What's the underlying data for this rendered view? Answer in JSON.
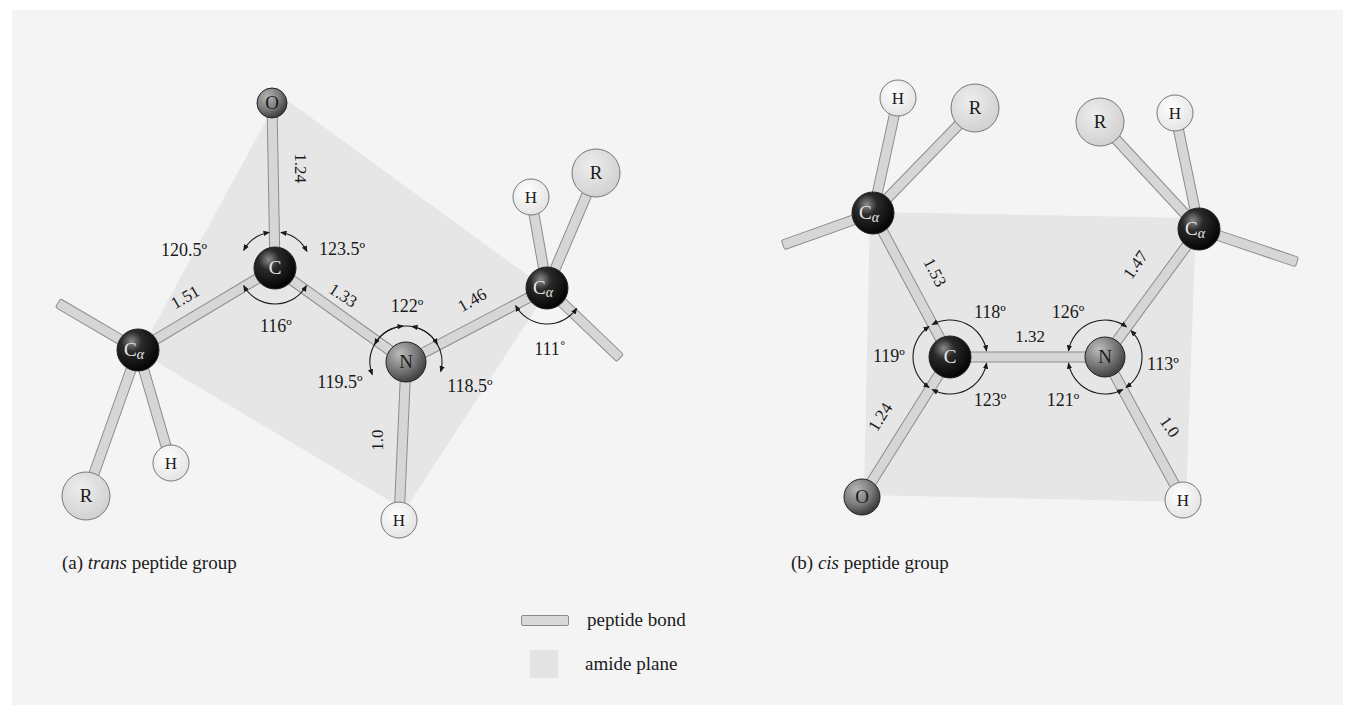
{
  "colors": {
    "background": "#ffffff",
    "panel": "#f4f4f4",
    "amide_plane": "#e3e3e3",
    "bond_fill": "#d6d6d6",
    "bond_stroke": "#8c8c8c",
    "carbon": "#151515",
    "nitrogen": "#6f6f6f",
    "oxygen": "#777777",
    "hydrogen": "#f0f0f0",
    "r_group": "#dcdcdc",
    "text": "#1a1a1a"
  },
  "panels": [
    {
      "id": "trans",
      "caption_prefix": "(a) ",
      "caption_italic": "trans",
      "caption_suffix": " peptide group",
      "amide_plane": [
        [
          140,
          352
        ],
        [
          280,
          95
        ],
        [
          548,
          290
        ],
        [
          405,
          510
        ]
      ],
      "atoms": [
        {
          "id": "O",
          "label": "O",
          "x": 272,
          "y": 103,
          "r": 15,
          "type": "oxygen"
        },
        {
          "id": "C",
          "label": "C",
          "x": 275,
          "y": 268,
          "r": 21,
          "type": "carbon"
        },
        {
          "id": "N",
          "label": "N",
          "x": 406,
          "y": 362,
          "r": 20,
          "type": "nitrogen"
        },
        {
          "id": "Ca1",
          "label": "C",
          "sub": "α",
          "x": 138,
          "y": 350,
          "r": 21,
          "type": "carbon"
        },
        {
          "id": "Ca2",
          "label": "C",
          "sub": "α",
          "x": 547,
          "y": 288,
          "r": 21,
          "type": "carbon"
        },
        {
          "id": "H_N",
          "label": "H",
          "x": 399,
          "y": 520,
          "r": 18,
          "type": "hydrogen"
        },
        {
          "id": "H1",
          "label": "H",
          "x": 171,
          "y": 463,
          "r": 18,
          "type": "hydrogen"
        },
        {
          "id": "R1",
          "label": "R",
          "x": 86,
          "y": 496,
          "r": 24,
          "type": "rgroup"
        },
        {
          "id": "H2",
          "label": "H",
          "x": 531,
          "y": 197,
          "r": 18,
          "type": "hydrogen"
        },
        {
          "id": "R2",
          "label": "R",
          "x": 596,
          "y": 173,
          "r": 24,
          "type": "rgroup"
        }
      ],
      "bonds": [
        {
          "a": "C",
          "b": "O"
        },
        {
          "a": "C",
          "b": "N"
        },
        {
          "a": "C",
          "b": "Ca1"
        },
        {
          "a": "N",
          "b": "Ca2"
        },
        {
          "a": "N",
          "b": "H_N"
        },
        {
          "a": "Ca1",
          "b": "H1"
        },
        {
          "a": "Ca1",
          "b": "R1"
        },
        {
          "a": "Ca2",
          "b": "H2"
        },
        {
          "a": "Ca2",
          "b": "R2"
        },
        {
          "a": "Ca1",
          "to": [
            58,
            303
          ]
        },
        {
          "a": "Ca2",
          "to": [
            620,
            358
          ]
        }
      ],
      "bond_lengths": [
        {
          "text": "1.24",
          "x": 295,
          "y": 168,
          "rot": 90
        },
        {
          "text": "1.51",
          "x": 188,
          "y": 302,
          "rot": -30
        },
        {
          "text": "1.33",
          "x": 340,
          "y": 300,
          "rot": 33
        },
        {
          "text": "1.46",
          "x": 475,
          "y": 305,
          "rot": -30
        },
        {
          "text": "1.0",
          "x": 383,
          "y": 440,
          "rot": -90
        }
      ],
      "angles": [
        {
          "text": "120.5º",
          "x": 184,
          "y": 256
        },
        {
          "text": "123.5º",
          "x": 342,
          "y": 255
        },
        {
          "text": "116º",
          "x": 276,
          "y": 332
        },
        {
          "text": "122º",
          "x": 407,
          "y": 312
        },
        {
          "text": "119.5º",
          "x": 340,
          "y": 388
        },
        {
          "text": "118.5º",
          "x": 470,
          "y": 392
        },
        {
          "text": "111˚",
          "x": 550,
          "y": 355
        }
      ],
      "arcs": [
        {
          "cx": 275,
          "cy": 268,
          "r": 36,
          "a1": -150,
          "a2": -100
        },
        {
          "cx": 275,
          "cy": 268,
          "r": 36,
          "a1": -80,
          "a2": -28
        },
        {
          "cx": 275,
          "cy": 268,
          "r": 36,
          "a1": 30,
          "a2": 150
        },
        {
          "cx": 406,
          "cy": 362,
          "r": 36,
          "a1": -150,
          "a2": -30
        },
        {
          "cx": 406,
          "cy": 362,
          "r": 36,
          "a1": 160,
          "a2": 265
        },
        {
          "cx": 406,
          "cy": 362,
          "r": 36,
          "a1": -80,
          "a2": 15
        },
        {
          "cx": 547,
          "cy": 288,
          "r": 36,
          "a1": 35,
          "a2": 150
        }
      ]
    },
    {
      "id": "cis",
      "caption_prefix": "(b) ",
      "caption_italic": "cis",
      "caption_suffix": " peptide group",
      "amide_plane": [
        [
          870,
          212
        ],
        [
          1196,
          218
        ],
        [
          1186,
          502
        ],
        [
          864,
          495
        ]
      ],
      "atoms": [
        {
          "id": "C",
          "label": "C",
          "x": 950,
          "y": 357,
          "r": 21,
          "type": "carbon"
        },
        {
          "id": "N",
          "label": "N",
          "x": 1105,
          "y": 357,
          "r": 20,
          "type": "nitrogen"
        },
        {
          "id": "O",
          "label": "O",
          "x": 862,
          "y": 497,
          "r": 18,
          "type": "oxygen"
        },
        {
          "id": "H_N",
          "label": "H",
          "x": 1183,
          "y": 500,
          "r": 18,
          "type": "hydrogen"
        },
        {
          "id": "Ca1",
          "label": "C",
          "sub": "α",
          "x": 873,
          "y": 213,
          "r": 21,
          "type": "carbon"
        },
        {
          "id": "Ca2",
          "label": "C",
          "sub": "α",
          "x": 1199,
          "y": 229,
          "r": 21,
          "type": "carbon"
        },
        {
          "id": "H1",
          "label": "H",
          "x": 898,
          "y": 98,
          "r": 18,
          "type": "hydrogen"
        },
        {
          "id": "R1",
          "label": "R",
          "x": 975,
          "y": 108,
          "r": 24,
          "type": "rgroup"
        },
        {
          "id": "R2",
          "label": "R",
          "x": 1100,
          "y": 122,
          "r": 24,
          "type": "rgroup"
        },
        {
          "id": "H2",
          "label": "H",
          "x": 1175,
          "y": 113,
          "r": 18,
          "type": "hydrogen"
        }
      ],
      "bonds": [
        {
          "a": "C",
          "b": "N"
        },
        {
          "a": "C",
          "b": "O"
        },
        {
          "a": "N",
          "b": "H_N"
        },
        {
          "a": "C",
          "b": "Ca1"
        },
        {
          "a": "N",
          "b": "Ca2"
        },
        {
          "a": "Ca1",
          "b": "H1"
        },
        {
          "a": "Ca1",
          "b": "R1"
        },
        {
          "a": "Ca2",
          "b": "R2"
        },
        {
          "a": "Ca2",
          "b": "H2"
        },
        {
          "a": "Ca1",
          "to": [
            783,
            245
          ]
        },
        {
          "a": "Ca2",
          "to": [
            1297,
            262
          ]
        }
      ],
      "bond_lengths": [
        {
          "text": "1.53",
          "x": 930,
          "y": 275,
          "rot": 62
        },
        {
          "text": "1.32",
          "x": 1030,
          "y": 342,
          "rot": 0
        },
        {
          "text": "1.47",
          "x": 1140,
          "y": 268,
          "rot": -55
        },
        {
          "text": "1.24",
          "x": 885,
          "y": 420,
          "rot": -58
        },
        {
          "text": "1.0",
          "x": 1165,
          "y": 430,
          "rot": 55
        }
      ],
      "angles": [
        {
          "text": "118º",
          "x": 990,
          "y": 318
        },
        {
          "text": "126º",
          "x": 1068,
          "y": 318
        },
        {
          "text": "119º",
          "x": 889,
          "y": 362
        },
        {
          "text": "113º",
          "x": 1163,
          "y": 370
        },
        {
          "text": "123º",
          "x": 990,
          "y": 406
        },
        {
          "text": "121º",
          "x": 1063,
          "y": 406
        }
      ],
      "arcs": [
        {
          "cx": 950,
          "cy": 357,
          "r": 37,
          "a1": -118,
          "a2": -10
        },
        {
          "cx": 950,
          "cy": 357,
          "r": 37,
          "a1": 125,
          "a2": 235
        },
        {
          "cx": 950,
          "cy": 357,
          "r": 37,
          "a1": 10,
          "a2": 118
        },
        {
          "cx": 1105,
          "cy": 357,
          "r": 37,
          "a1": -170,
          "a2": -55
        },
        {
          "cx": 1105,
          "cy": 357,
          "r": 37,
          "a1": -45,
          "a2": 55
        },
        {
          "cx": 1105,
          "cy": 357,
          "r": 37,
          "a1": 62,
          "a2": 170
        }
      ]
    }
  ],
  "legend": {
    "items": [
      {
        "kind": "bond",
        "label": "peptide bond"
      },
      {
        "kind": "plane",
        "label": "amide plane"
      }
    ]
  }
}
